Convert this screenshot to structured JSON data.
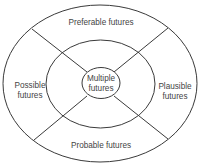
{
  "diagram": {
    "center": {
      "line1": "Multiple",
      "line2": "futures"
    },
    "segments": {
      "top": {
        "label": "Preferable futures"
      },
      "left": {
        "line1": "Possible",
        "line2": "futures"
      },
      "right": {
        "line1": "Plausible",
        "line2": "futures"
      },
      "bottom": {
        "label": "Probable futures"
      }
    },
    "colors": {
      "stroke": "#3a3a3a",
      "text": "#444444",
      "background": "#ffffff"
    }
  }
}
